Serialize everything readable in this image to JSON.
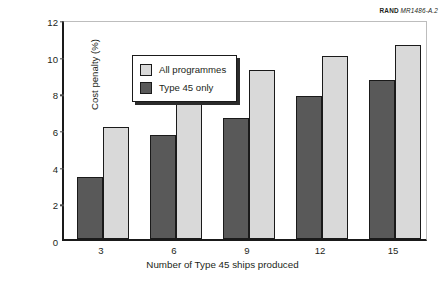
{
  "figure_id": {
    "org": "RAND",
    "code": "MR1486-A.2"
  },
  "legend": {
    "items": [
      {
        "label": "All programmes",
        "color": "#d9d9d9",
        "swatch": "light"
      },
      {
        "label": "Type 45 only",
        "color": "#595959",
        "swatch": "dark"
      }
    ]
  },
  "chart_data": {
    "type": "bar",
    "title": "",
    "xlabel": "Number of Type 45 ships produced",
    "ylabel": "Cost penalty (%)",
    "categories": [
      "3",
      "6",
      "9",
      "12",
      "15"
    ],
    "yticks": [
      "0",
      "2",
      "4",
      "6",
      "8",
      "10",
      "12"
    ],
    "ylim": [
      0,
      12
    ],
    "grid": false,
    "legend_position": "top-left inside",
    "series": [
      {
        "name": "Type 45 only",
        "color": "#595959",
        "values": [
          3.4,
          5.7,
          6.6,
          7.8,
          8.7
        ]
      },
      {
        "name": "All programmes",
        "color": "#d9d9d9",
        "values": [
          6.1,
          8.3,
          9.2,
          10.0,
          10.6
        ]
      }
    ]
  }
}
